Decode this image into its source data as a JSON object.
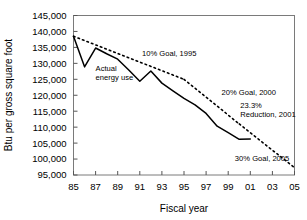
{
  "chart_data": {
    "type": "line",
    "title": "",
    "xlabel": "Fiscal year",
    "ylabel": "Btu per gross square foot",
    "xlim": [
      85,
      105
    ],
    "ylim": [
      95000,
      145000
    ],
    "grid": false,
    "legend": "none (inline annotations)",
    "y_ticks": [
      "95,000",
      "100,000",
      "105,000",
      "110,000",
      "115,000",
      "120,000",
      "125,000",
      "130,000",
      "135,000",
      "140,000",
      "145,000"
    ],
    "y_tick_values": [
      95000,
      100000,
      105000,
      110000,
      115000,
      120000,
      125000,
      130000,
      135000,
      140000,
      145000
    ],
    "x_ticks": [
      "85",
      "87",
      "89",
      "91",
      "93",
      "95",
      "97",
      "99",
      "01",
      "03",
      "05"
    ],
    "x_tick_values": [
      85,
      87,
      89,
      91,
      93,
      95,
      97,
      99,
      101,
      103,
      105
    ],
    "series": [
      {
        "name": "Actual energy use",
        "style": "solid",
        "x": [
          85,
          86,
          87,
          88,
          89,
          90,
          91,
          92,
          93,
          94,
          95,
          96,
          97,
          98,
          99,
          100,
          101
        ],
        "values": [
          138500,
          128900,
          134800,
          133000,
          131300,
          127900,
          124400,
          127600,
          123800,
          121400,
          119000,
          117000,
          114300,
          110300,
          108300,
          106200,
          106300
        ]
      },
      {
        "name": "10% Goal, 1995",
        "style": "dotted",
        "x": [
          85,
          95
        ],
        "values": [
          138500,
          125000
        ]
      },
      {
        "name": "20% Goal, 2000",
        "style": "dotted",
        "x": [
          95,
          100
        ],
        "values": [
          125000,
          111000
        ]
      },
      {
        "name": "30% Goal, 2005",
        "style": "dotted",
        "x": [
          100,
          105
        ],
        "values": [
          111000,
          97300
        ]
      }
    ],
    "annotations": [
      {
        "name": "actual-energy-use",
        "text_lines": [
          "Actual",
          "energy use"
        ],
        "x": 87.0,
        "y": 127500
      },
      {
        "name": "goal-10-percent",
        "text_lines": [
          "10% Goal, 1995"
        ],
        "x": 91.2,
        "y": 132200
      },
      {
        "name": "goal-20-percent",
        "text_lines": [
          "20% Goal, 2000"
        ],
        "x": 98.4,
        "y": 120100
      },
      {
        "name": "reduction-2001",
        "text_lines": [
          "23.3%",
          "Reduction, 2001"
        ],
        "x": 100.1,
        "y": 116100
      },
      {
        "name": "goal-30-percent",
        "text_lines": [
          "30% Goal, 2005"
        ],
        "x": 99.6,
        "y": 99400
      }
    ],
    "colors": {
      "line": "#000000",
      "frame": "#7a7a7a",
      "background": "#ffffff"
    }
  }
}
